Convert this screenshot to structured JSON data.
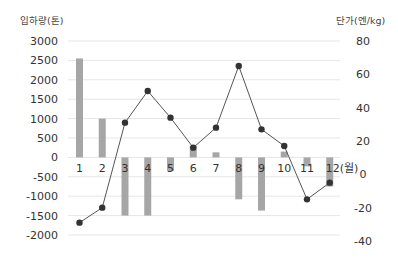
{
  "chart_data": {
    "type": "bar+line",
    "title": "",
    "categories": [
      "1",
      "2",
      "3",
      "4",
      "5",
      "6",
      "7",
      "8",
      "9",
      "10",
      "11",
      "12(월)"
    ],
    "series": [
      {
        "name": "입하량(톤)",
        "type": "bar",
        "axis": "left",
        "values": [
          2550,
          1000,
          -1500,
          -1500,
          -350,
          300,
          130,
          -1080,
          -1370,
          150,
          -230,
          -750
        ]
      },
      {
        "name": "단가(엔/kg)",
        "type": "line",
        "axis": "right",
        "values": [
          -29,
          -20,
          31,
          50,
          34,
          16,
          28,
          65,
          27,
          17,
          -15,
          -5
        ]
      }
    ],
    "left_axis": {
      "label": "입하량(톤)",
      "ylim": [
        -2000,
        3000
      ],
      "ticks": [
        3000,
        2500,
        2000,
        1500,
        1000,
        500,
        0,
        -500,
        -1000,
        -1500,
        -2000
      ]
    },
    "right_axis": {
      "label": "단가(엔/kg)",
      "ylim": [
        -40,
        80
      ],
      "ticks": [
        80,
        60,
        40,
        20,
        0,
        -20,
        -40
      ]
    },
    "grid": true,
    "legend": "none",
    "colors": {
      "bar": "#a6a6a6",
      "line": "#555555",
      "marker": "#333333",
      "grid": "#e6e6e6"
    }
  }
}
